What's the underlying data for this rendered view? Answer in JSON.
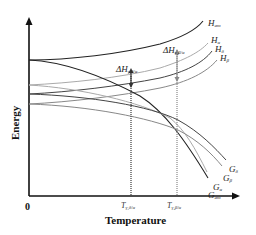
{
  "diagram": {
    "axes": {
      "x_label": "Temperature",
      "y_label": "Energy",
      "origin_label": "0"
    },
    "ticks": [
      {
        "main": "T",
        "sub": "γ,δ/α",
        "x": 131
      },
      {
        "main": "T",
        "sub": "γ,β/α",
        "x": 177
      }
    ],
    "annotations": [
      {
        "main": "ΔH",
        "sub": "γ,δ/α",
        "x": 116,
        "y": 59
      },
      {
        "main": "ΔH",
        "sub": "γ,β/α",
        "x": 163,
        "y": 41
      }
    ],
    "curve_labels": {
      "H_am": {
        "main": "H",
        "sub": "am"
      },
      "H_a": {
        "main": "H",
        "sub": "α"
      },
      "H_d": {
        "main": "H",
        "sub": "δ"
      },
      "H_b": {
        "main": "H",
        "sub": "β"
      },
      "G_d": {
        "main": "G",
        "sub": "δ"
      },
      "G_b": {
        "main": "G",
        "sub": "β"
      },
      "G_a": {
        "main": "G",
        "sub": "α"
      },
      "G_am": {
        "main": "G",
        "sub": "am"
      }
    },
    "colors": {
      "axis": "#111111",
      "dark_curve": "#222222",
      "mid_curve": "#555555",
      "light_curve": "#9a9a9a",
      "dotted": "#777777"
    }
  }
}
